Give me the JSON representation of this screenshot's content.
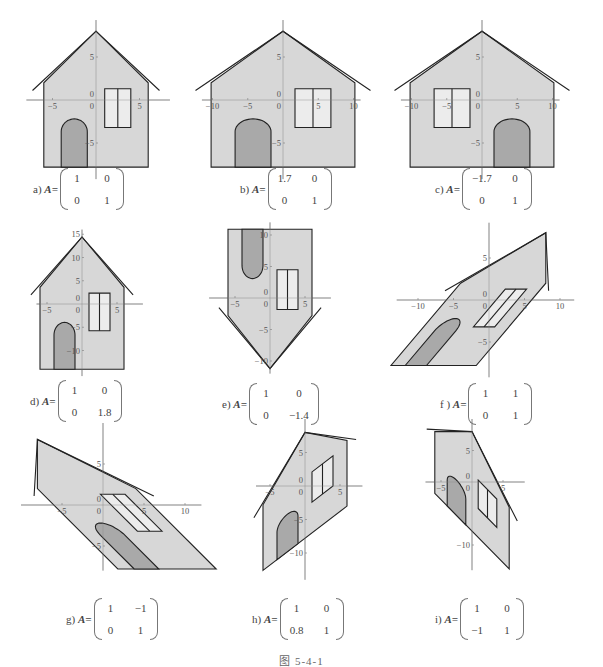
{
  "figure": {
    "caption": "图    5-4-1",
    "base_house": {
      "walls_x": [
        -6,
        6
      ],
      "bottom_y": -7.8,
      "eave_y": 2,
      "peak_y": 8,
      "overhang_x": 7.3,
      "overhang_y": 1.1,
      "door": {
        "x0": -4,
        "x1": -1,
        "top_y": -2.2,
        "radius": 1.5
      },
      "window": {
        "x0": 1,
        "x1": 4,
        "y_top": 1.3,
        "y_bottom": -3.2,
        "mid_x": 2.5
      }
    },
    "colors": {
      "house_fill": "#d4d4d4",
      "door_fill": "#a9a9a9",
      "window_fill": "#ececec",
      "outline": "#222222",
      "axis": "#888888"
    },
    "panels": [
      {
        "id": "a",
        "label": "a) ",
        "var": "A=",
        "matrix": [
          [
            "1",
            "0"
          ],
          [
            "0",
            "1"
          ]
        ],
        "m": [
          [
            1,
            0
          ],
          [
            0,
            1
          ]
        ],
        "origin": [
          96,
          100
        ],
        "sx": 8.7,
        "sy": 8.6,
        "xaxis": [
          -8,
          8.5
        ],
        "yaxis": [
          -9.2,
          9.3
        ],
        "xticks": [
          -5,
          5
        ],
        "yticks": [
          5,
          -5
        ],
        "label_pos": [
          33,
          168
        ]
      },
      {
        "id": "b",
        "label": "b) ",
        "var": "A=",
        "matrix": [
          [
            "1.7",
            "0"
          ],
          [
            "0",
            "1"
          ]
        ],
        "m": [
          [
            1.7,
            0
          ],
          [
            0,
            1
          ]
        ],
        "origin": [
          283,
          100
        ],
        "sx": 7.05,
        "sy": 8.6,
        "xaxis": [
          -11.5,
          11
        ],
        "yaxis": [
          -9.2,
          9.3
        ],
        "xticks": [
          -10,
          -5,
          5,
          10
        ],
        "yticks": [
          5,
          -5
        ],
        "label_pos": [
          240,
          168
        ]
      },
      {
        "id": "c",
        "label": "c) ",
        "var": "A=",
        "matrix": [
          [
            "-1.7",
            "0"
          ],
          [
            "0",
            "1"
          ]
        ],
        "m": [
          [
            -1.7,
            0
          ],
          [
            0,
            1
          ]
        ],
        "origin": [
          482,
          100
        ],
        "sx": 7.05,
        "sy": 8.6,
        "xaxis": [
          -11.5,
          11
        ],
        "yaxis": [
          -9.2,
          9.3
        ],
        "xticks": [
          -10,
          -5,
          5,
          10
        ],
        "yticks": [
          5,
          -5
        ],
        "label_pos": [
          435,
          168
        ]
      },
      {
        "id": "d",
        "label": "d) ",
        "var": "A=",
        "matrix": [
          [
            "1",
            "0"
          ],
          [
            "0",
            "1.8"
          ]
        ],
        "m": [
          [
            1,
            0
          ],
          [
            0,
            1.8
          ]
        ],
        "origin": [
          82,
          304
        ],
        "sx": 7.0,
        "sy": 4.65,
        "xaxis": [
          -6.5,
          8.7
        ],
        "yaxis": [
          -15.5,
          16
        ],
        "xticks": [
          -5,
          5
        ],
        "yticks": [
          15,
          10,
          5,
          -5,
          -10
        ],
        "label_pos": [
          30,
          380
        ]
      },
      {
        "id": "e",
        "label": "e) ",
        "var": "A=",
        "matrix": [
          [
            "1",
            "0"
          ],
          [
            "0",
            "-1.4"
          ]
        ],
        "m": [
          [
            1,
            0
          ],
          [
            0,
            -1.4
          ]
        ],
        "origin": [
          270,
          298
        ],
        "sx": 7.0,
        "sy": 6.3,
        "xaxis": [
          -8.7,
          8.7
        ],
        "yaxis": [
          -12,
          12
        ],
        "xticks": [
          -5,
          5
        ],
        "yticks": [
          10,
          5,
          -5,
          -10
        ],
        "label_pos": [
          222,
          383
        ]
      },
      {
        "id": "f",
        "label": "f ) ",
        "var": "A=",
        "matrix": [
          [
            "1",
            "1"
          ],
          [
            "0",
            "1"
          ]
        ],
        "m": [
          [
            1,
            1
          ],
          [
            0,
            1
          ]
        ],
        "origin": [
          489,
          300
        ],
        "sx": 7.1,
        "sy": 8.4,
        "xaxis": [
          -13,
          12
        ],
        "yaxis": [
          -9.2,
          9.2
        ],
        "xticks": [
          -10,
          -5,
          5,
          10
        ],
        "yticks": [
          5,
          -5
        ],
        "label_pos": [
          440,
          383
        ]
      },
      {
        "id": "g",
        "label": "g) ",
        "var": "A=",
        "matrix": [
          [
            "1",
            "-1"
          ],
          [
            "0",
            "1"
          ]
        ],
        "m": [
          [
            1,
            -1
          ],
          [
            0,
            1
          ]
        ],
        "origin": [
          103,
          505
        ],
        "sx": 8.2,
        "sy": 8.2,
        "xaxis": [
          -10,
          12
        ],
        "yaxis": [
          -8,
          10
        ],
        "xticks": [
          -5,
          5,
          10
        ],
        "yticks": [
          5,
          -5
        ],
        "label_pos": [
          66,
          598
        ]
      },
      {
        "id": "h",
        "label": "h) ",
        "var": "A=",
        "matrix": [
          [
            "1",
            "0"
          ],
          [
            "0.8",
            "1"
          ]
        ],
        "m": [
          [
            1,
            0
          ],
          [
            0.8,
            1
          ]
        ],
        "origin": [
          305,
          486
        ],
        "sx": 7.0,
        "sy": 6.7,
        "xaxis": [
          -7,
          8.2
        ],
        "yaxis": [
          -14,
          10
        ],
        "xticks": [
          -5,
          5
        ],
        "yticks": [
          5,
          -5,
          -10
        ],
        "label_pos": [
          252,
          598
        ]
      },
      {
        "id": "i",
        "label": "i) ",
        "var": "A=",
        "matrix": [
          [
            "1",
            "0"
          ],
          [
            "-1",
            "1"
          ]
        ],
        "m": [
          [
            1,
            0
          ],
          [
            -1,
            1
          ]
        ],
        "origin": [
          472,
          482
        ],
        "sx": 6.2,
        "sy": 6.3,
        "xaxis": [
          -7.5,
          8.5
        ],
        "yaxis": [
          -14,
          10
        ],
        "xticks": [
          -5,
          5
        ],
        "yticks": [
          5,
          -10
        ],
        "label_pos": [
          435,
          598
        ]
      }
    ]
  }
}
